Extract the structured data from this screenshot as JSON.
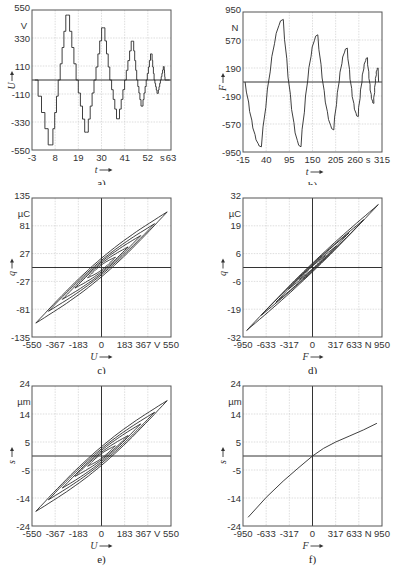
{
  "chart_data": [
    {
      "id": "a",
      "type": "line",
      "caption": "a)",
      "xlabel": "t",
      "ylabel": "U",
      "xunit": "s",
      "yunit": "V",
      "xlim": [
        -3,
        63
      ],
      "ylim": [
        -550,
        550
      ],
      "xticks": [
        "-3",
        "8",
        "19",
        "30",
        "41",
        "52",
        "63"
      ],
      "yticks": [
        "550",
        "330",
        "110",
        "-110",
        "-330",
        "-550"
      ],
      "description": "Staircase voltage U(t) with decaying amplitude alternating sign",
      "peaks": [
        {
          "t": 5.5,
          "value": -510
        },
        {
          "t": 13.5,
          "value": 510
        },
        {
          "t": 22.5,
          "value": -410
        },
        {
          "t": 30.5,
          "value": 410
        },
        {
          "t": 37.5,
          "value": -305
        },
        {
          "t": 44.5,
          "value": 305
        },
        {
          "t": 49,
          "value": -205
        },
        {
          "t": 53.5,
          "value": 205
        },
        {
          "t": 56.5,
          "value": -105
        },
        {
          "t": 59.5,
          "value": 105
        }
      ]
    },
    {
      "id": "b",
      "type": "line",
      "caption": "b)",
      "xlabel": "t",
      "ylabel": "F",
      "xunit": "s",
      "yunit": "N",
      "xlim": [
        -15,
        315
      ],
      "ylim": [
        -950,
        950
      ],
      "xticks": [
        "-15",
        "40",
        "95",
        "150",
        "205",
        "260 s",
        "315"
      ],
      "yticks": [
        "950",
        "570",
        "190",
        "-190",
        "-570",
        "-950"
      ],
      "description": "Force F(t) response with decaying amplitude",
      "peaks": [
        {
          "t": 28,
          "value": -880
        },
        {
          "t": 80,
          "value": 850
        },
        {
          "t": 122,
          "value": -880
        },
        {
          "t": 162,
          "value": 640
        },
        {
          "t": 200,
          "value": -650
        },
        {
          "t": 232,
          "value": 460
        },
        {
          "t": 258,
          "value": -470
        },
        {
          "t": 280,
          "value": 330
        },
        {
          "t": 295,
          "value": -290
        },
        {
          "t": 305,
          "value": 190
        }
      ]
    },
    {
      "id": "c",
      "type": "line",
      "caption": "c)",
      "xlabel": "U",
      "ylabel": "q",
      "xunit": "V",
      "yunit": "µC",
      "xlim": [
        -550,
        550
      ],
      "ylim": [
        -135,
        135
      ],
      "xticks": [
        "-550",
        "-367",
        "-183",
        "0",
        "183",
        "367 V",
        "550"
      ],
      "yticks": [
        "135",
        "81",
        "27",
        "-27",
        "-81",
        "-135"
      ],
      "description": "Hysteresis loops of charge q vs voltage U",
      "loops": [
        {
          "umax": 520,
          "qmax": 108,
          "width": 18
        },
        {
          "umax": 420,
          "qmax": 85,
          "width": 14
        },
        {
          "umax": 310,
          "qmax": 62,
          "width": 11
        },
        {
          "umax": 210,
          "qmax": 40,
          "width": 8
        },
        {
          "umax": 110,
          "qmax": 20,
          "width": 5
        }
      ]
    },
    {
      "id": "d",
      "type": "line",
      "caption": "d)",
      "xlabel": "F",
      "ylabel": "q",
      "xunit": "N",
      "yunit": "µC",
      "xlim": [
        -950,
        950
      ],
      "ylim": [
        -32,
        32
      ],
      "xticks": [
        "-950",
        "-633",
        "-317",
        "0",
        "317",
        "633 N",
        "950"
      ],
      "yticks": [
        "32",
        "19",
        "6",
        "-6",
        "-19",
        "-32"
      ],
      "description": "Charge q vs force F, narrow loops",
      "loops": [
        {
          "umax": 900,
          "qmax": 29,
          "width": 2.0
        },
        {
          "umax": 700,
          "qmax": 22,
          "width": 1.6
        },
        {
          "umax": 500,
          "qmax": 16,
          "width": 1.2
        },
        {
          "umax": 330,
          "qmax": 10,
          "width": 0.9
        },
        {
          "umax": 180,
          "qmax": 5.5,
          "width": 0.6
        }
      ]
    },
    {
      "id": "e",
      "type": "line",
      "caption": "e)",
      "xlabel": "U",
      "ylabel": "s",
      "xunit": "V",
      "yunit": "µm",
      "xlim": [
        -550,
        550
      ],
      "ylim": [
        -24,
        24
      ],
      "xticks": [
        "-550",
        "-367",
        "-183",
        "0",
        "183",
        "367 V",
        "550"
      ],
      "yticks": [
        "24",
        "14",
        "5",
        "-5",
        "-14",
        "-24"
      ],
      "description": "Hysteresis loops of displacement s vs voltage U",
      "loops": [
        {
          "umax": 520,
          "qmax": 19,
          "width": 3.2
        },
        {
          "umax": 420,
          "qmax": 15,
          "width": 2.5
        },
        {
          "umax": 310,
          "qmax": 11,
          "width": 1.9
        },
        {
          "umax": 210,
          "qmax": 7,
          "width": 1.3
        },
        {
          "umax": 110,
          "qmax": 3.5,
          "width": 0.8
        }
      ]
    },
    {
      "id": "f",
      "type": "line",
      "caption": "f)",
      "xlabel": "F",
      "ylabel": "s",
      "xunit": "N",
      "yunit": "µm",
      "xlim": [
        -950,
        950
      ],
      "ylim": [
        -24,
        24
      ],
      "xticks": [
        "-950",
        "-633",
        "-317",
        "0",
        "317",
        "633 N",
        "950"
      ],
      "yticks": [
        "24",
        "14",
        "5",
        "-5",
        "-14",
        "-24"
      ],
      "description": "Displacement s vs force F, nearly single curve, steeper for negative F",
      "x": [
        -880,
        -633,
        -400,
        -200,
        0,
        150,
        317,
        500,
        700,
        880
      ],
      "y": [
        -21,
        -14.2,
        -8.6,
        -4.2,
        0,
        2.6,
        4.8,
        6.8,
        9.0,
        11.2
      ]
    }
  ]
}
